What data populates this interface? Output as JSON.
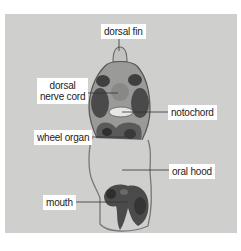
{
  "figure": {
    "colors": {
      "background": "#cfcfcd",
      "tissue_dark": "#3e3e3e",
      "tissue_mid": "#7a7a7a",
      "tissue_light": "#b9b9b7",
      "label_bg": "#ffffff",
      "label_text": "#222222",
      "leader_line": "#333333"
    },
    "labels": {
      "dorsal_fin": "dorsal fin",
      "dorsal_nerve_cord_line1": "dorsal",
      "dorsal_nerve_cord_line2": "nerve cord",
      "notochord": "notochord",
      "wheel_organ": "wheel organ",
      "oral_hood": "oral hood",
      "mouth": "mouth"
    }
  }
}
